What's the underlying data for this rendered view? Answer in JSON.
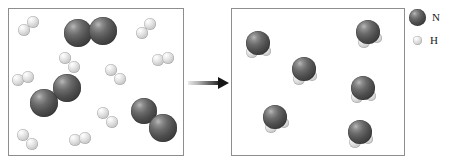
{
  "figure": {
    "arrow_name": "reaction-arrow",
    "arrow_direction": "right"
  },
  "legend": {
    "items": [
      {
        "key": "N",
        "label": "N",
        "element": "nitrogen",
        "color": "#4e4e4e",
        "radius_px": 8.5
      },
      {
        "key": "H",
        "label": "H",
        "element": "hydrogen",
        "color": "#dcdcdc",
        "radius_px": 4.5
      }
    ]
  },
  "boxes": [
    {
      "id": "reactants",
      "name": "reactants-box",
      "border_color": "#8e8e8e",
      "background": "#ffffff",
      "molecules": [
        {
          "species": "N2",
          "x": 92,
          "y": 33,
          "atoms": [
            {
              "el": "N",
              "dx": -14,
              "dy": 0,
              "r": 14
            },
            {
              "el": "N",
              "dx": 11,
              "dy": -2,
              "r": 14
            }
          ]
        },
        {
          "species": "N2",
          "x": 57,
          "y": 96,
          "atoms": [
            {
              "el": "N",
              "dx": -13,
              "dy": 7,
              "r": 14
            },
            {
              "el": "N",
              "dx": 10,
              "dy": -8,
              "r": 14
            }
          ]
        },
        {
          "species": "N2",
          "x": 155,
          "y": 120,
          "atoms": [
            {
              "el": "N",
              "dx": -11,
              "dy": -9,
              "r": 13
            },
            {
              "el": "N",
              "dx": 8,
              "dy": 8,
              "r": 14
            }
          ]
        },
        {
          "species": "H2",
          "x": 29,
          "y": 26,
          "atoms": [
            {
              "el": "H",
              "dx": -5,
              "dy": 4,
              "r": 6
            },
            {
              "el": "H",
              "dx": 4,
              "dy": -4,
              "r": 6
            }
          ]
        },
        {
          "species": "H2",
          "x": 146,
          "y": 28,
          "atoms": [
            {
              "el": "H",
              "dx": -4,
              "dy": 5,
              "r": 6
            },
            {
              "el": "H",
              "dx": 4,
              "dy": -4,
              "r": 6
            }
          ]
        },
        {
          "species": "H2",
          "x": 70,
          "y": 62,
          "atoms": [
            {
              "el": "H",
              "dx": -5,
              "dy": -4,
              "r": 6
            },
            {
              "el": "H",
              "dx": 4,
              "dy": 5,
              "r": 6
            }
          ]
        },
        {
          "species": "H2",
          "x": 163,
          "y": 59,
          "atoms": [
            {
              "el": "H",
              "dx": -5,
              "dy": 1,
              "r": 6
            },
            {
              "el": "H",
              "dx": 5,
              "dy": -1,
              "r": 6
            }
          ]
        },
        {
          "species": "H2",
          "x": 23,
          "y": 79,
          "atoms": [
            {
              "el": "H",
              "dx": -5,
              "dy": 1,
              "r": 6
            },
            {
              "el": "H",
              "dx": 5,
              "dy": -2,
              "r": 6
            }
          ]
        },
        {
          "species": "H2",
          "x": 116,
          "y": 74,
          "atoms": [
            {
              "el": "H",
              "dx": -5,
              "dy": -4,
              "r": 6
            },
            {
              "el": "H",
              "dx": 4,
              "dy": 5,
              "r": 6
            }
          ]
        },
        {
          "species": "H2",
          "x": 108,
          "y": 117,
          "atoms": [
            {
              "el": "H",
              "dx": -5,
              "dy": -4,
              "r": 6
            },
            {
              "el": "H",
              "dx": 4,
              "dy": 5,
              "r": 6
            }
          ]
        },
        {
          "species": "H2",
          "x": 28,
          "y": 139,
          "atoms": [
            {
              "el": "H",
              "dx": -5,
              "dy": -4,
              "r": 6
            },
            {
              "el": "H",
              "dx": 4,
              "dy": 5,
              "r": 6
            }
          ]
        },
        {
          "species": "H2",
          "x": 80,
          "y": 139,
          "atoms": [
            {
              "el": "H",
              "dx": -5,
              "dy": 1,
              "r": 6
            },
            {
              "el": "H",
              "dx": 5,
              "dy": -1,
              "r": 6
            }
          ]
        }
      ]
    },
    {
      "id": "products",
      "name": "products-box",
      "border_color": "#8e8e8e",
      "background": "#ffffff",
      "molecules": [
        {
          "species": "NH3",
          "x": 258,
          "y": 43,
          "atoms": [
            {
              "el": "H",
              "dx": -6,
              "dy": 9,
              "r": 6
            },
            {
              "el": "H",
              "dx": 8,
              "dy": 8,
              "r": 5
            },
            {
              "el": "N",
              "dx": 0,
              "dy": 0,
              "r": 12
            }
          ]
        },
        {
          "species": "NH3",
          "x": 368,
          "y": 32,
          "atoms": [
            {
              "el": "H",
              "dx": -4,
              "dy": 10,
              "r": 6
            },
            {
              "el": "H",
              "dx": 9,
              "dy": 6,
              "r": 5
            },
            {
              "el": "N",
              "dx": 0,
              "dy": 0,
              "r": 12
            }
          ]
        },
        {
          "species": "NH3",
          "x": 304,
          "y": 69,
          "atoms": [
            {
              "el": "H",
              "dx": -5,
              "dy": 10,
              "r": 6
            },
            {
              "el": "H",
              "dx": 8,
              "dy": 7,
              "r": 5
            },
            {
              "el": "N",
              "dx": 0,
              "dy": 0,
              "r": 12
            }
          ]
        },
        {
          "species": "NH3",
          "x": 363,
          "y": 88,
          "atoms": [
            {
              "el": "H",
              "dx": -6,
              "dy": 9,
              "r": 6
            },
            {
              "el": "H",
              "dx": 8,
              "dy": 8,
              "r": 5
            },
            {
              "el": "N",
              "dx": 0,
              "dy": 0,
              "r": 12
            }
          ]
        },
        {
          "species": "NH3",
          "x": 275,
          "y": 117,
          "atoms": [
            {
              "el": "H",
              "dx": -4,
              "dy": 10,
              "r": 6
            },
            {
              "el": "H",
              "dx": 9,
              "dy": 6,
              "r": 5
            },
            {
              "el": "N",
              "dx": 0,
              "dy": 0,
              "r": 12
            }
          ]
        },
        {
          "species": "NH3",
          "x": 360,
          "y": 132,
          "atoms": [
            {
              "el": "H",
              "dx": -5,
              "dy": 10,
              "r": 6
            },
            {
              "el": "H",
              "dx": 8,
              "dy": 7,
              "r": 5
            },
            {
              "el": "N",
              "dx": 0,
              "dy": 0,
              "r": 12
            }
          ]
        }
      ]
    }
  ]
}
